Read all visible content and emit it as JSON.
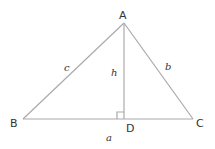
{
  "diagram": {
    "type": "triangle-with-altitude",
    "line_color": "#aaaaaa",
    "text_color": "#333333",
    "vertices": {
      "A": {
        "label": "A",
        "x": 124,
        "y": 23
      },
      "B": {
        "label": "B",
        "x": 23,
        "y": 119
      },
      "C": {
        "label": "C",
        "x": 193,
        "y": 119
      },
      "D": {
        "label": "D",
        "x": 124,
        "y": 119
      }
    },
    "sides": {
      "a": {
        "label": "a"
      },
      "b": {
        "label": "b"
      },
      "c": {
        "label": "c"
      },
      "h": {
        "label": "h"
      }
    },
    "right_angle_marker": {
      "at": "D",
      "size": 7
    }
  }
}
